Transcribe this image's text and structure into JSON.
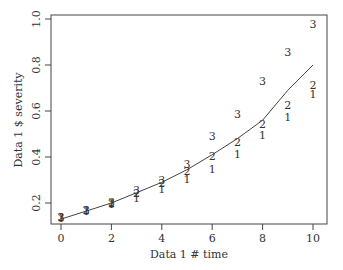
{
  "chart_data": {
    "type": "scatter",
    "title": "",
    "xlabel": "Data 1 # time",
    "ylabel": "Data 1 $ severity",
    "xlim": [
      -0.4,
      10.6
    ],
    "ylim": [
      0.11,
      1.02
    ],
    "xticks": [
      0,
      2,
      4,
      6,
      8,
      10
    ],
    "yticks": [
      0.2,
      0.4,
      0.6,
      0.8,
      1.0
    ],
    "ytick_labels": [
      "0.2",
      "0.4",
      "0.6",
      "0.8",
      "1.0"
    ],
    "grid": false,
    "legend": null,
    "series": [
      {
        "name": "1",
        "marker": "1",
        "x": [
          0,
          1,
          2,
          3,
          4,
          5,
          6,
          7,
          8,
          9,
          10
        ],
        "y": [
          0.135,
          0.165,
          0.195,
          0.22,
          0.26,
          0.305,
          0.35,
          0.415,
          0.495,
          0.575,
          0.675
        ]
      },
      {
        "name": "2",
        "marker": "2",
        "x": [
          0,
          1,
          2,
          3,
          4,
          5,
          6,
          7,
          8,
          9,
          10
        ],
        "y": [
          0.14,
          0.17,
          0.2,
          0.245,
          0.285,
          0.34,
          0.405,
          0.465,
          0.545,
          0.625,
          0.715
        ]
      },
      {
        "name": "3",
        "marker": "3",
        "x": [
          0,
          1,
          2,
          3,
          4,
          5,
          6,
          7,
          8,
          9,
          10
        ],
        "y": [
          0.14,
          0.17,
          0.205,
          0.255,
          0.3,
          0.37,
          0.49,
          0.585,
          0.73,
          0.855,
          0.98
        ]
      }
    ],
    "fitted_curve": {
      "name": "fit",
      "x": [
        0,
        1,
        2,
        3,
        4,
        5,
        6,
        7,
        8,
        9,
        10
      ],
      "y": [
        0.13,
        0.165,
        0.2,
        0.245,
        0.29,
        0.345,
        0.41,
        0.48,
        0.56,
        0.69,
        0.8
      ]
    }
  }
}
